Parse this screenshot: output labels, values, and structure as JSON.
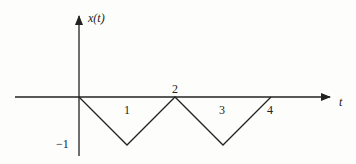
{
  "figure": {
    "y_axis_label": "x(t)",
    "x_axis_label": "t",
    "tick_labels": {
      "t1": "1",
      "t2": "2",
      "t3": "3",
      "t4": "4",
      "y_neg1": "−1"
    },
    "signal": {
      "description": "Periodic triangular wave",
      "points": [
        [
          0,
          0
        ],
        [
          1,
          -1
        ],
        [
          2,
          0
        ],
        [
          3,
          -1
        ],
        [
          4,
          0
        ]
      ]
    },
    "line_color": "#222222",
    "background": "#fdfdfb"
  }
}
